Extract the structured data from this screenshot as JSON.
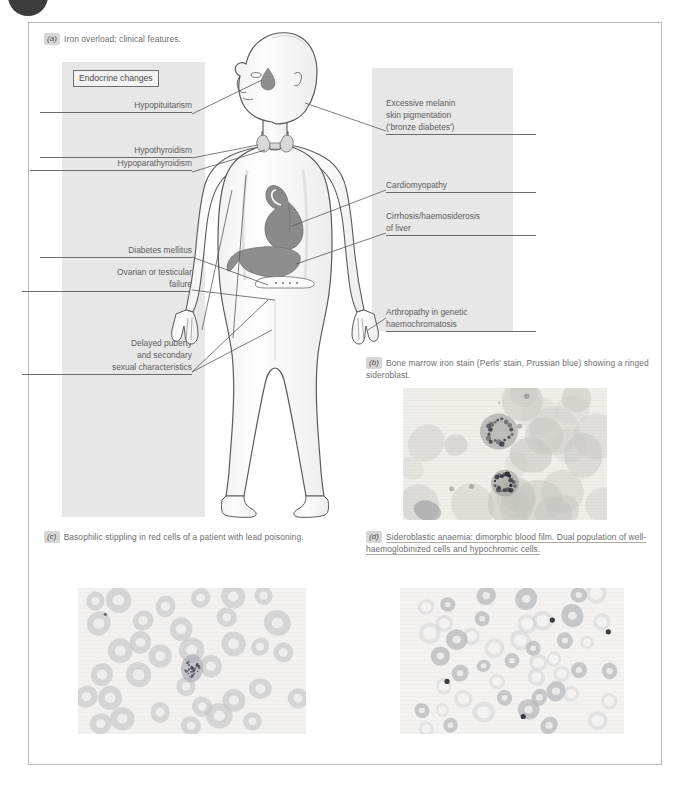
{
  "figure": {
    "corner_badge": "chapter-circle-marker"
  },
  "panels": {
    "a": {
      "tag": "(a)",
      "caption": "Iron overload: clinical features.",
      "box_heading": "Endocrine changes",
      "left_labels": [
        {
          "lines": [
            "Hypopituitarism"
          ],
          "align": "right"
        },
        {
          "lines": [
            "Hypothyroidism"
          ],
          "align": "right"
        },
        {
          "lines": [
            "Hypoparathyroidism"
          ],
          "align": "right"
        },
        {
          "lines": [
            "Diabetes mellitus"
          ],
          "align": "right"
        },
        {
          "lines": [
            "Ovarian or testicular",
            "failure"
          ],
          "align": "right"
        },
        {
          "lines": [
            "Delayed puberty",
            "and secondary",
            "sexual characteristics"
          ],
          "align": "right"
        }
      ],
      "right_labels": [
        {
          "lines": [
            "Excessive melanin",
            "skin pigmentation",
            "('bronze diabetes')"
          ],
          "align": "left"
        },
        {
          "lines": [
            "Cardiomyopathy"
          ],
          "align": "left"
        },
        {
          "lines": [
            "Cirrhosis/haemosiderosis",
            "of liver"
          ],
          "align": "left"
        },
        {
          "lines": [
            "Arthropathy in genetic",
            "haemochromatosis"
          ],
          "align": "left"
        }
      ],
      "anatomy": [
        "human-body-outline",
        "pituitary-gland",
        "thyroid-gland",
        "heart",
        "liver",
        "pancreas"
      ]
    },
    "b": {
      "tag": "(b)",
      "caption": "Bone marrow iron stain (Perls' stain, Prussian blue) showing a ringed sideroblast.",
      "image_alt": "bone-marrow-iron-stain-micrograph"
    },
    "c": {
      "tag": "(c)",
      "caption": "Basophilic stippling in red cells of a patient with lead poisoning.",
      "image_alt": "basophilic-stippling-blood-film-micrograph"
    },
    "d": {
      "tag": "(d)",
      "caption": "Sideroblastic anaemia: dimorphic blood film. Dual population of well-haemoglobinized cells and hypochromic cells.",
      "image_alt": "sideroblastic-anaemia-dimorphic-blood-film-micrograph"
    }
  },
  "colors": {
    "panel_grey": "#e7e7e7",
    "border_grey": "#b9b9b9",
    "text_grey": "#5d5d5d",
    "organ_dark": "#8e8e8e",
    "body_fill": "#fbfbfb",
    "badge_dark": "#2b2b2b"
  }
}
